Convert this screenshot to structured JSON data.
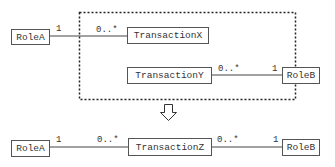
{
  "before": {
    "classes": {
      "roleA": "RoleA",
      "transactionX": "TransactionX",
      "transactionY": "TransactionY",
      "roleB": "RoleB"
    },
    "associations": [
      {
        "from": "RoleA",
        "to": "TransactionX",
        "from_mult": "1",
        "to_mult": "0..*"
      },
      {
        "from": "TransactionY",
        "to": "RoleB",
        "from_mult": "0..*",
        "to_mult": "1"
      }
    ],
    "grouping": "dashed boundary around TransactionX and TransactionY"
  },
  "arrow": "down-arrow",
  "after": {
    "classes": {
      "roleA": "RoleA",
      "transactionZ": "TransactionZ",
      "roleB": "RoleB"
    },
    "associations": [
      {
        "from": "RoleA",
        "to": "TransactionZ",
        "from_mult": "1",
        "to_mult": "0..*"
      },
      {
        "from": "TransactionZ",
        "to": "RoleB",
        "from_mult": "0..*",
        "to_mult": "1"
      }
    ]
  }
}
